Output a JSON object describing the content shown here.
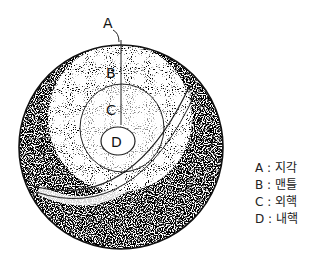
{
  "diagram": {
    "labels": {
      "A": "A",
      "B": "B",
      "C": "C",
      "D": "D"
    },
    "legend": [
      {
        "key": "A",
        "text": "A : 지각"
      },
      {
        "key": "B",
        "text": "B : 맨틀"
      },
      {
        "key": "C",
        "text": "C : 외핵"
      },
      {
        "key": "D",
        "text": "D : 내핵"
      }
    ]
  }
}
